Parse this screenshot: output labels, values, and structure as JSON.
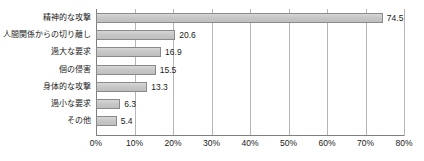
{
  "chart_data": {
    "type": "bar",
    "orientation": "horizontal",
    "title": "",
    "subtitle": "",
    "xlabel": "",
    "ylabel": "",
    "xlim": [
      0,
      80
    ],
    "xtick_values": [
      0,
      10,
      20,
      30,
      40,
      50,
      60,
      70,
      80
    ],
    "xtick_labels": [
      "0%",
      "10%",
      "20%",
      "30%",
      "40%",
      "50%",
      "60%",
      "70%",
      "80%"
    ],
    "grid": true,
    "legend": false,
    "bar_color": "#c9c9c9",
    "bar_border_color": "#8a8a8a",
    "grid_color": "#b5b5b5",
    "axis_color": "#808080",
    "categories": [
      "精神的な攻撃",
      "人間関係からの切り離し",
      "過大な要求",
      "個の侵害",
      "身体的な攻撃",
      "過小な要求",
      "その他"
    ],
    "values": [
      74.5,
      20.6,
      16.9,
      15.5,
      13.3,
      6.3,
      5.4
    ],
    "value_labels": [
      "74.5",
      "20.6",
      "16.9",
      "15.5",
      "13.3",
      "6.3",
      "5.4"
    ]
  }
}
